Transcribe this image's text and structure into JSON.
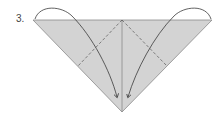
{
  "diagram": {
    "step_label": "3.",
    "colors": {
      "paper_fill": "#d3d3d3",
      "outline": "#8a8a8a",
      "arrow": "#3a3a3a",
      "dash": "#555555"
    }
  }
}
